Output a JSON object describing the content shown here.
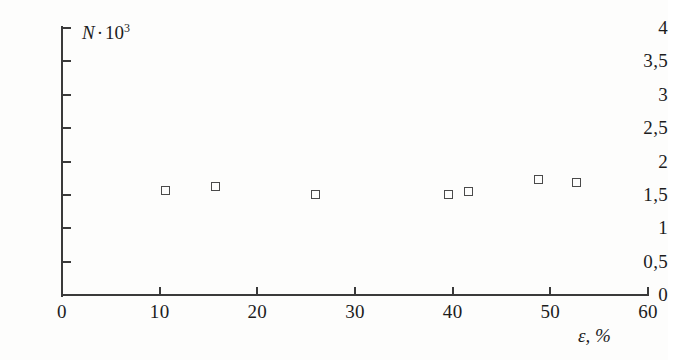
{
  "chart_data": {
    "type": "scatter",
    "title": "",
    "subtitle": "",
    "xlabel": "ε, %",
    "ylabel": "N · 10³",
    "ylabel_parts": {
      "variable": "N",
      "operator": "·",
      "base": "10",
      "exponent": "3"
    },
    "xlim": [
      0,
      60
    ],
    "ylim": [
      0,
      4
    ],
    "xticks": [
      0,
      10,
      20,
      30,
      40,
      50,
      60
    ],
    "yticks": [
      0,
      0.5,
      1,
      1.5,
      2,
      2.5,
      3,
      3.5,
      4
    ],
    "xticklabels": [
      "0",
      "10",
      "20",
      "30",
      "40",
      "50",
      "60"
    ],
    "yticklabels": [
      "0",
      "0,5",
      "1",
      "1,5",
      "2",
      "2,5",
      "3",
      "3,5",
      "4"
    ],
    "decimal_separator": ",",
    "grid": false,
    "legend": false,
    "legend_position": "none",
    "marker_style": "open-square",
    "marker_color": "#4a4a4a",
    "axis_color": "#3a3a3a",
    "background_color": "#fdfdfc",
    "series": [
      {
        "name": "N",
        "points": [
          {
            "x": 10.6,
            "y": 1.56
          },
          {
            "x": 15.8,
            "y": 1.62
          },
          {
            "x": 26.0,
            "y": 1.5
          },
          {
            "x": 39.6,
            "y": 1.5
          },
          {
            "x": 41.7,
            "y": 1.55
          },
          {
            "x": 48.8,
            "y": 1.73
          },
          {
            "x": 52.7,
            "y": 1.68
          }
        ]
      }
    ]
  }
}
